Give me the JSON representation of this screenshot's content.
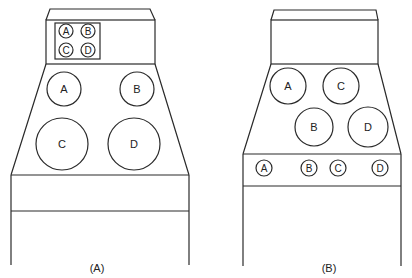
{
  "figures": [
    {
      "caption": "(A)",
      "legend_circles": [
        {
          "label": "A",
          "cx": 66,
          "cy": 31,
          "r": 7
        },
        {
          "label": "B",
          "cx": 88,
          "cy": 31,
          "r": 7
        },
        {
          "label": "C",
          "cx": 66,
          "cy": 50,
          "r": 7
        },
        {
          "label": "D",
          "cx": 88,
          "cy": 50,
          "r": 7
        }
      ],
      "main_circles": [
        {
          "label": "A",
          "cx": 64,
          "cy": 89,
          "r": 17
        },
        {
          "label": "B",
          "cx": 137,
          "cy": 89,
          "r": 17
        },
        {
          "label": "C",
          "cx": 62,
          "cy": 168,
          "r": 26
        },
        {
          "label": "D",
          "cx": 134,
          "cy": 168,
          "r": 26
        }
      ]
    },
    {
      "caption": "(B)",
      "main_circles": [
        {
          "label": "A",
          "cx": 288,
          "cy": 86,
          "r": 18
        },
        {
          "label": "C",
          "cx": 341,
          "cy": 86,
          "r": 18
        },
        {
          "label": "B",
          "cx": 314,
          "cy": 127,
          "r": 19
        },
        {
          "label": "D",
          "cx": 368,
          "cy": 127,
          "r": 20
        }
      ],
      "band_circles": [
        {
          "label": "A",
          "cx": 264,
          "cy": 168,
          "r": 8
        },
        {
          "label": "B",
          "cx": 309,
          "cy": 168,
          "r": 8
        },
        {
          "label": "C",
          "cx": 338,
          "cy": 168,
          "r": 8
        },
        {
          "label": "D",
          "cx": 380,
          "cy": 168,
          "r": 8
        }
      ]
    }
  ]
}
